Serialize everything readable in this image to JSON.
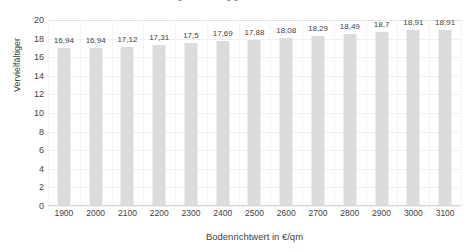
{
  "chart_data": {
    "type": "bar",
    "title": "",
    "title_cutoff_fragment": "Vervielfältiger in Abhängigkeit vom Bodenrichtwert",
    "xlabel": "Bodenrichtwert in €/qm",
    "ylabel": "Vervielfältiger",
    "categories": [
      "1900",
      "2000",
      "2100",
      "2200",
      "2300",
      "2400",
      "2500",
      "2600",
      "2700",
      "2800",
      "2900",
      "3000",
      "3100"
    ],
    "values": [
      16.94,
      16.94,
      17.12,
      17.31,
      17.5,
      17.69,
      17.88,
      18.08,
      18.29,
      18.49,
      18.7,
      18.91,
      18.91
    ],
    "data_labels": [
      "16,94",
      "16,94",
      "17,12",
      "17,31",
      "17,5",
      "17,69",
      "17,88",
      "18,08",
      "18,29",
      "18,49",
      "18,7",
      "18,91",
      "18,91"
    ],
    "ylim": [
      0,
      20
    ],
    "yticks": [
      0,
      2,
      4,
      6,
      8,
      10,
      12,
      14,
      16,
      18,
      20
    ],
    "ytick_labels": [
      "0",
      "2",
      "4",
      "6",
      "8",
      "10",
      "12",
      "14",
      "16",
      "18",
      "20"
    ],
    "grid": true,
    "grid_axis": "both",
    "legend": false,
    "legend_position": "none",
    "bar_color": "#dcdcdc",
    "gridline_color": "#f0f0f0",
    "text_color": "#3f3f3f"
  }
}
